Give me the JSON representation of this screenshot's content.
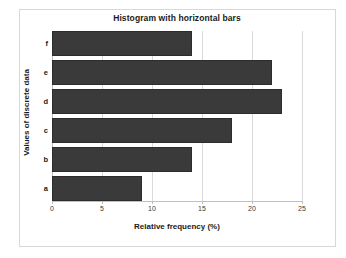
{
  "chart_data": {
    "type": "bar",
    "orientation": "horizontal",
    "title": "Histogram with horizontal bars",
    "xlabel": "Relative frequency (%)",
    "ylabel": "Values of discrete data",
    "categories": [
      "a",
      "b",
      "c",
      "d",
      "e",
      "f"
    ],
    "values": [
      9,
      14,
      18,
      23,
      22,
      14
    ],
    "xlim": [
      0,
      25
    ],
    "xticks": [
      0,
      5,
      10,
      15,
      20,
      25
    ],
    "xtick_labels": [
      "0",
      "5",
      "10",
      "15",
      "20",
      "25"
    ],
    "grid": "vertical",
    "legend": null,
    "bar_color": "#3a3a3a",
    "gridline_color": "#d9d9d9",
    "frame_color": "#d8d8d8",
    "background": "#ffffff",
    "bars": [
      {
        "category": "f",
        "value": 14
      },
      {
        "category": "e",
        "value": 22
      },
      {
        "category": "d",
        "value": 23
      },
      {
        "category": "c",
        "value": 18
      },
      {
        "category": "b",
        "value": 14
      },
      {
        "category": "a",
        "value": 9
      }
    ]
  }
}
